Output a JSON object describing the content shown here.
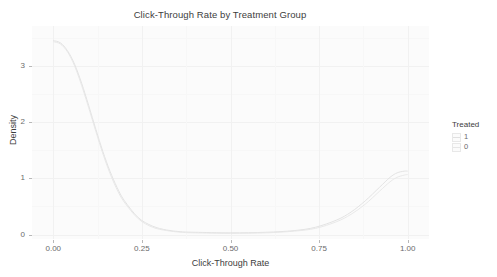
{
  "chart_data": {
    "type": "line",
    "title": "Click-Through Rate by Treatment Group",
    "xlabel": "Click-Through Rate",
    "ylabel": "Density",
    "xlim": [
      -0.06,
      1.06
    ],
    "ylim": [
      -0.08,
      3.72
    ],
    "xticks": [
      "0.00",
      "0.25",
      "0.50",
      "0.75",
      "1.00"
    ],
    "xtick_values": [
      0.0,
      0.25,
      0.5,
      0.75,
      1.0
    ],
    "yticks": [
      "0",
      "1",
      "2",
      "3"
    ],
    "ytick_values": [
      0,
      1,
      2,
      3
    ],
    "grid": true,
    "legend_position": "right",
    "legend_title": "Treated",
    "series": [
      {
        "name": "1",
        "color": "#e0e0e0",
        "x": [
          0.0,
          0.02,
          0.04,
          0.06,
          0.08,
          0.1,
          0.12,
          0.14,
          0.16,
          0.18,
          0.2,
          0.24,
          0.28,
          0.32,
          0.36,
          0.4,
          0.5,
          0.6,
          0.68,
          0.74,
          0.8,
          0.84,
          0.88,
          0.92,
          0.95,
          0.97,
          0.99,
          1.0
        ],
        "values": [
          3.46,
          3.42,
          3.28,
          3.04,
          2.7,
          2.3,
          1.88,
          1.48,
          1.13,
          0.84,
          0.61,
          0.3,
          0.15,
          0.08,
          0.05,
          0.04,
          0.03,
          0.04,
          0.07,
          0.13,
          0.26,
          0.4,
          0.6,
          0.84,
          1.02,
          1.1,
          1.13,
          1.13
        ]
      },
      {
        "name": "0",
        "color": "#e6e6e6",
        "x": [
          0.0,
          0.02,
          0.04,
          0.06,
          0.08,
          0.1,
          0.12,
          0.14,
          0.16,
          0.18,
          0.2,
          0.24,
          0.28,
          0.32,
          0.36,
          0.4,
          0.5,
          0.6,
          0.68,
          0.74,
          0.8,
          0.84,
          0.88,
          0.92,
          0.95,
          0.97,
          0.99,
          1.0
        ],
        "values": [
          3.44,
          3.4,
          3.26,
          3.01,
          2.66,
          2.26,
          1.84,
          1.44,
          1.09,
          0.8,
          0.58,
          0.28,
          0.13,
          0.07,
          0.04,
          0.03,
          0.02,
          0.03,
          0.06,
          0.11,
          0.23,
          0.36,
          0.54,
          0.77,
          0.94,
          1.02,
          1.06,
          1.07
        ]
      }
    ]
  },
  "legend": {
    "title": "Treated",
    "items": [
      {
        "label": "1",
        "color": "#e0e0e0"
      },
      {
        "label": "0",
        "color": "#e6e6e6"
      }
    ]
  }
}
